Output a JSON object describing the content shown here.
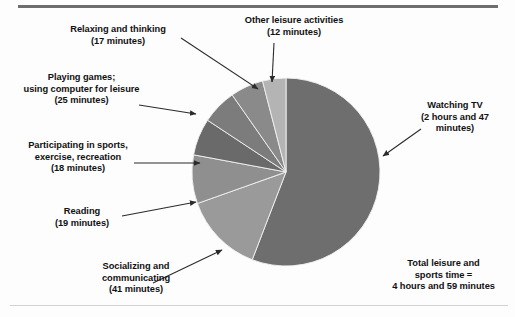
{
  "figure": {
    "kind": "pie-chart-figure",
    "background_color": "#fdfdfd",
    "rule_color": "#6e6e6e"
  },
  "chart_data": {
    "type": "pie",
    "title": "",
    "unit": "minutes",
    "total_label": "Total leisure and\nsports time =\n4 hours and 59 minutes",
    "total_minutes": 299,
    "categories": [
      "Watching TV",
      "Socializing and communicating",
      "Playing games; using computer for leisure",
      "Reading",
      "Participating in sports, exercise, recreation",
      "Relaxing and thinking",
      "Other leisure activities"
    ],
    "values": [
      167,
      41,
      25,
      19,
      18,
      17,
      12
    ],
    "value_labels": [
      "2 hours and 47 minutes",
      "41 minutes",
      "25 minutes",
      "19 minutes",
      "18 minutes",
      "17 minutes",
      "12 minutes"
    ],
    "colors": [
      "#6e6e6e",
      "#9a9a9a",
      "#8f8f8f",
      "#6a6a6a",
      "#7c7c7c",
      "#8a8a8a",
      "#b4b4b4"
    ],
    "legend": "callout-labels",
    "grid": false
  },
  "callouts": {
    "relaxing": {
      "line1": "Relaxing and thinking",
      "line2": "(17 minutes)"
    },
    "playing_games": {
      "line1": "Playing games;",
      "line2": "using computer for leisure",
      "line3": "(25 minutes)"
    },
    "sports": {
      "line1": "Participating in sports,",
      "line2": "exercise, recreation",
      "line3": "(18 minutes)"
    },
    "reading": {
      "line1": "Reading",
      "line2": "(19 minutes)"
    },
    "socializing": {
      "line1": "Socializing and",
      "line2": "communicating",
      "line3": "(41 minutes)"
    },
    "other_leisure": {
      "line1": "Other leisure activities",
      "line2": "(12 minutes)"
    },
    "watching_tv": {
      "line1": "Watching TV",
      "line2": "(2 hours and 47",
      "line3": "minutes)"
    },
    "total": {
      "line1": "Total leisure and",
      "line2": "sports time =",
      "line3": "4 hours and 59 minutes"
    }
  }
}
